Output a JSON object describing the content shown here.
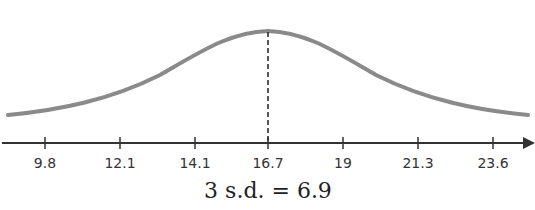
{
  "diagram": {
    "type": "normal-distribution-curve",
    "mean_label": "16.7",
    "caption": "3 s.d. = 6.9",
    "colors": {
      "curve": "#8a8a8a",
      "axis": "#333333",
      "dashed_line": "#222222"
    }
  },
  "chart_data": {
    "type": "line",
    "title": "",
    "xlabel": "",
    "ylabel": "",
    "tick_labels": [
      "9.8",
      "12.1",
      "14.1",
      "16.7",
      "19",
      "21.3",
      "23.6"
    ],
    "x": [
      9.8,
      12.1,
      14.1,
      16.7,
      19,
      21.3,
      23.6
    ],
    "mean": 16.7,
    "standard_deviation": 2.3,
    "annotation": "3 s.d. = 6.9",
    "grid": false
  },
  "axis": {
    "ticks": [
      {
        "label": "9.8",
        "x": 45
      },
      {
        "label": "12.1",
        "x": 120
      },
      {
        "label": "14.1",
        "x": 195
      },
      {
        "label": "16.7",
        "x": 268
      },
      {
        "label": "19",
        "x": 343
      },
      {
        "label": "21.3",
        "x": 418
      },
      {
        "label": "23.6",
        "x": 493
      }
    ]
  }
}
